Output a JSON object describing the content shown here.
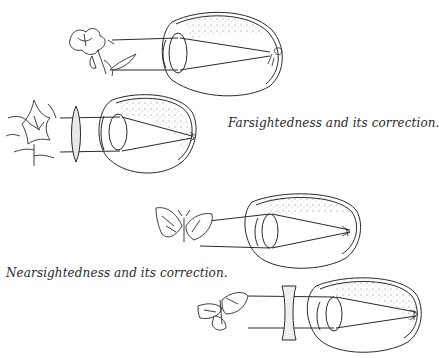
{
  "figure": {
    "panels": [
      {
        "id": "farsighted-uncorrected",
        "object": "flower",
        "lens": "none",
        "focus": "behind-retina"
      },
      {
        "id": "farsighted-corrected",
        "object": "lily-flower",
        "lens": "convex",
        "focus": "on-retina"
      },
      {
        "id": "nearsighted-uncorrected",
        "object": "butterfly",
        "lens": "none",
        "focus": "in-front-of-retina"
      },
      {
        "id": "nearsighted-corrected",
        "object": "moth",
        "lens": "concave",
        "focus": "on-retina"
      }
    ],
    "captions": {
      "farsightedness": "Farsightedness and its correction.",
      "nearsightedness": "Nearsightedness and its correction."
    },
    "colors": {
      "ink": "#2a2a2a",
      "background": "#ffffff",
      "stipple": "#555555"
    }
  }
}
